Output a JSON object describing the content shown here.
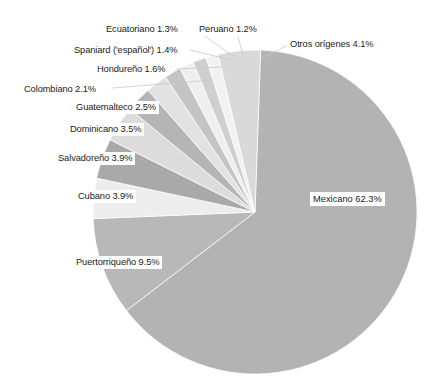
{
  "chart_data": {
    "type": "pie",
    "title": "",
    "subtitle": "",
    "xlabel": "",
    "ylabel": "",
    "legend_position": "none",
    "grid": false,
    "units": "percent",
    "categories": [
      "Mexicano",
      "Puertorriqueño",
      "Cubano",
      "Salvadoreño",
      "Dominicano",
      "Guatemalteco",
      "Colombiano",
      "Hondureño",
      "Spaniard ('español')",
      "Ecuatoriano",
      "Peruano",
      "Otros orígenes"
    ],
    "values": [
      62.3,
      9.5,
      3.9,
      3.9,
      3.5,
      2.5,
      2.1,
      1.6,
      1.4,
      1.3,
      1.2,
      4.1
    ],
    "slice_colors": [
      "#b3b3b3",
      "#b8b8b8",
      "#ededed",
      "#a9a9a9",
      "#dcdcdc",
      "#b5b5b5",
      "#e2e2e2",
      "#c4c4c4",
      "#efefef",
      "#cfcfcf",
      "#f2f2f2",
      "#d9d9d9"
    ],
    "slices": [
      {
        "label": "Mexicano 62.3%",
        "name": "Mexicano",
        "value": 62.3,
        "color": "#b3b3b3"
      },
      {
        "label": "Puertorriqueño 9.5%",
        "name": "Puertorriqueño",
        "value": 9.5,
        "color": "#b8b8b8"
      },
      {
        "label": "Cubano 3.9%",
        "name": "Cubano",
        "value": 3.9,
        "color": "#ededed"
      },
      {
        "label": "Salvadoreño 3.9%",
        "name": "Salvadoreño",
        "value": 3.9,
        "color": "#a9a9a9"
      },
      {
        "label": "Dominicano 3.5%",
        "name": "Dominicano",
        "value": 3.5,
        "color": "#dcdcdc"
      },
      {
        "label": "Guatemalteco 2.5%",
        "name": "Guatemalteco",
        "value": 2.5,
        "color": "#b5b5b5"
      },
      {
        "label": "Colombiano 2.1%",
        "name": "Colombiano",
        "value": 2.1,
        "color": "#e2e2e2"
      },
      {
        "label": "Hondureño 1.6%",
        "name": "Hondureño",
        "value": 1.6,
        "color": "#c4c4c4"
      },
      {
        "label": "Spaniard ('español') 1.4%",
        "name": "Spaniard ('español')",
        "value": 1.4,
        "color": "#efefef"
      },
      {
        "label": "Ecuatoriano 1.3%",
        "name": "Ecuatoriano",
        "value": 1.3,
        "color": "#cfcfcf"
      },
      {
        "label": "Peruano 1.2%",
        "name": "Peruano",
        "value": 1.2,
        "color": "#f2f2f2"
      },
      {
        "label": "Otros orígenes 4.1%",
        "name": "Otros orígenes",
        "value": 4.1,
        "color": "#d9d9d9"
      }
    ]
  },
  "labels": {
    "mexicano": "Mexicano 62.3%",
    "puertorriqueno": "Puertorriqueño 9.5%",
    "cubano": "Cubano 3.9%",
    "salvadoreno": "Salvadoreño 3.9%",
    "dominicano": "Dominicano 3.5%",
    "guatemalteco": "Guatemalteco 2.5%",
    "colombiano": "Colombiano 2.1%",
    "hondureno": "Hondureño 1.6%",
    "spaniard": "Spaniard ('español') 1.4%",
    "ecuatoriano": "Ecuatoriano 1.3%",
    "peruano": "Peruano 1.2%",
    "otros": "Otros orígenes 4.1%"
  }
}
